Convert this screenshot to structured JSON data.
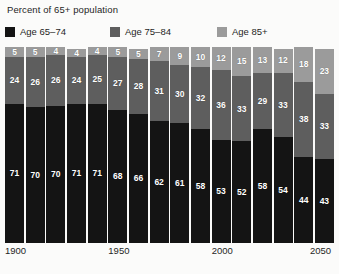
{
  "chart_data": {
    "type": "bar",
    "subtype": "stacked-bar-100pct",
    "title": "Percent of 65+ population",
    "xlabel": "",
    "ylabel": "",
    "ylim": [
      0,
      100
    ],
    "grid": false,
    "legend_position": "top",
    "categories": [
      "1900",
      "1910",
      "1920",
      "1930",
      "1940",
      "1950",
      "1960",
      "1970",
      "1980",
      "1990",
      "2000",
      "2010",
      "2020",
      "2030",
      "2040",
      "2050"
    ],
    "tick_labels": [
      "1900",
      "1950",
      "2000",
      "2050"
    ],
    "tick_positions": [
      0,
      5,
      10,
      15
    ],
    "series": [
      {
        "name": "Age 65–74",
        "color": "#141414",
        "values": [
          71,
          70,
          70,
          71,
          71,
          68,
          66,
          62,
          61,
          58,
          53,
          52,
          58,
          54,
          44,
          43
        ]
      },
      {
        "name": "Age 75–84",
        "color": "#5e5e5e",
        "values": [
          24,
          26,
          26,
          24,
          25,
          27,
          28,
          31,
          30,
          32,
          36,
          33,
          29,
          33,
          38,
          33
        ]
      },
      {
        "name": "Age 85+",
        "color": "#9b9b9b",
        "values": [
          5,
          5,
          4,
          4,
          4,
          5,
          5,
          7,
          9,
          10,
          12,
          15,
          13,
          12,
          18,
          23
        ]
      }
    ]
  },
  "colors": {
    "background": "#fbfbfa",
    "text": "#1f1f1f",
    "label_text": "#ffffff",
    "age_65_74": "#141414",
    "age_75_84": "#5e5e5e",
    "age_85_plus": "#9b9b9b"
  }
}
